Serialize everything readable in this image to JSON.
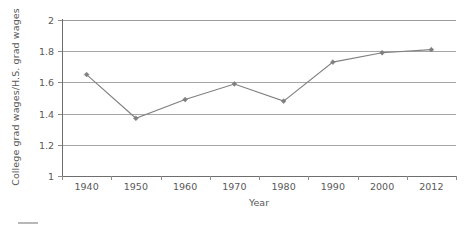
{
  "chart_data": {
    "type": "line",
    "title": "",
    "subtitle": "",
    "xlabel": "Year",
    "ylabel": "College grad wages/H.S. grad wages",
    "categories": [
      "1940",
      "1950",
      "1960",
      "1970",
      "1980",
      "1990",
      "2000",
      "2012"
    ],
    "x": [
      1940,
      1950,
      1960,
      1970,
      1980,
      1990,
      2000,
      2012
    ],
    "values": [
      1.65,
      1.37,
      1.49,
      1.59,
      1.48,
      1.73,
      1.79,
      1.81
    ],
    "series": [
      {
        "name": "College grad wages/H.S. grad wages",
        "values": [
          1.65,
          1.37,
          1.49,
          1.59,
          1.48,
          1.73,
          1.79,
          1.81
        ]
      }
    ],
    "ylim": [
      1,
      2
    ],
    "yticks": [
      1,
      1.2,
      1.4,
      1.6,
      1.8,
      2
    ],
    "ytick_labels": [
      "1",
      "1.2",
      "1.4",
      "1.6",
      "1.8",
      "2"
    ],
    "grid": "horizontal",
    "legend_position": "bottom",
    "marker": "diamond",
    "colors": {
      "series_line": "#808080",
      "marker": "#7f7f7f",
      "gridline": "#a6a6a6",
      "axis": "#6e6e6e",
      "tick_label": "#595959",
      "background": "#ffffff"
    }
  },
  "axis": {
    "y_title": "College grad wages/H.S. grad wages",
    "x_title": "Year",
    "y_labels": [
      "2",
      "1.8",
      "1.6",
      "1.4",
      "1.2",
      "1"
    ],
    "x_labels": [
      "1940",
      "1950",
      "1960",
      "1970",
      "1980",
      "1990",
      "2000",
      "2012"
    ]
  }
}
